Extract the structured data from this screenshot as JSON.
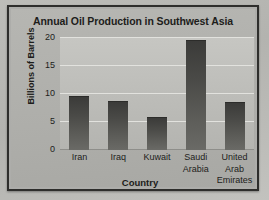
{
  "chart_data": {
    "type": "bar",
    "title": "Annual Oil Production in Southwest Asia",
    "xlabel": "Country",
    "ylabel": "Billions of Barrels",
    "categories": [
      "Iran",
      "Iraq",
      "Kuwait",
      "Saudi Arabia",
      "United Arab Emirates"
    ],
    "category_lines": [
      [
        "Iran"
      ],
      [
        "Iraq"
      ],
      [
        "Kuwait"
      ],
      [
        "Saudi",
        "Arabia"
      ],
      [
        "United",
        "Arab",
        "Emirates"
      ]
    ],
    "values": [
      9.5,
      8.5,
      5.7,
      19.5,
      8.4
    ],
    "ylim": [
      0,
      20
    ],
    "yticks": [
      20,
      15,
      10,
      5,
      0
    ],
    "ytick_labels": [
      "20",
      "15",
      "10",
      "5",
      "0"
    ],
    "grid": true,
    "legend": false,
    "colors": {
      "bar_top": "#3b3b39",
      "bar_bottom": "#6a6a66",
      "plot_background": "#bcbcb8",
      "gridline": "#e2e2de",
      "frame": "#2e2e2c",
      "text": "#1d1d1b"
    }
  }
}
